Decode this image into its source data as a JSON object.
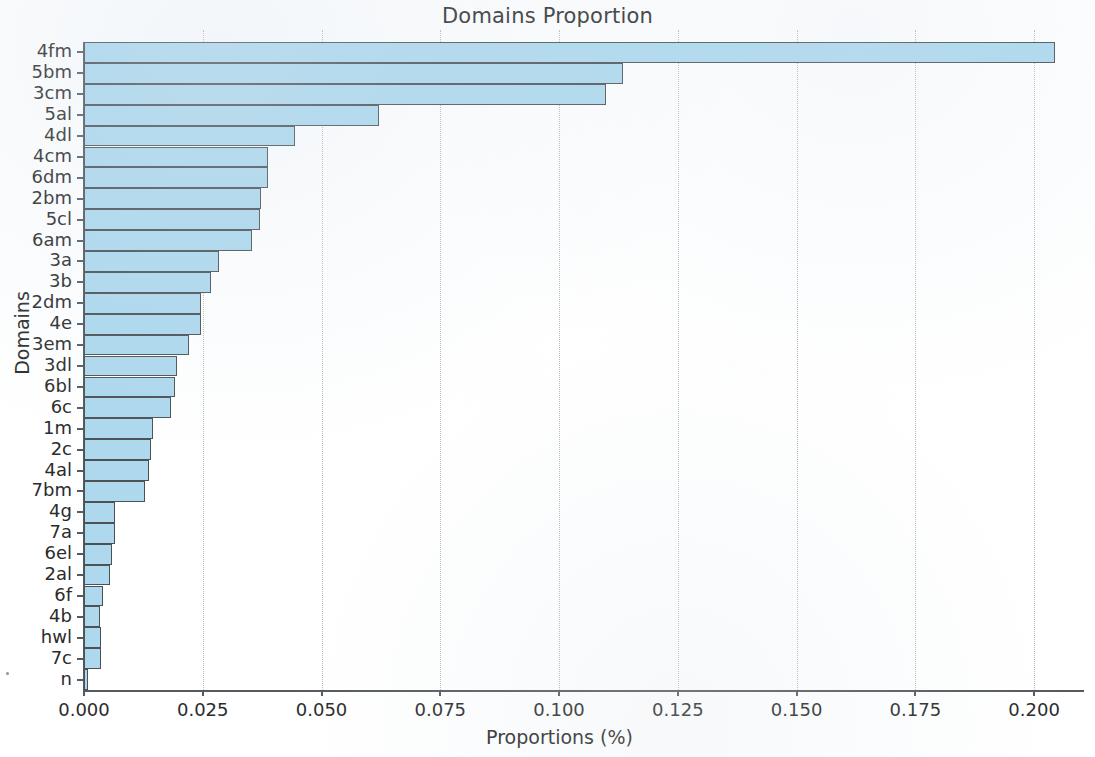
{
  "chart_data": {
    "type": "bar",
    "orientation": "horizontal",
    "title": "Domains Proportion",
    "xlabel": "Proportions (%)",
    "ylabel": "Domains",
    "xlim": [
      0.0,
      0.2105
    ],
    "grid": true,
    "grid_axis": "x",
    "legend": null,
    "bar_color": "#add8ee",
    "bar_edge_color": "#4b5155",
    "xticks": [
      0.0,
      0.025,
      0.05,
      0.075,
      0.1,
      0.125,
      0.15,
      0.175,
      0.2
    ],
    "xtick_labels": [
      "0.000",
      "0.025",
      "0.050",
      "0.075",
      "0.100",
      "0.125",
      "0.150",
      "0.175",
      "0.200"
    ],
    "categories": [
      "4fm",
      "5bm",
      "3cm",
      "5al",
      "4dl",
      "4cm",
      "6dm",
      "2bm",
      "5cl",
      "6am",
      "3a",
      "3b",
      "2dm",
      "4e",
      "3em",
      "3dl",
      "6bl",
      "6c",
      "1m",
      "2c",
      "4al",
      "7bm",
      "4g",
      "7a",
      "6el",
      "2al",
      "6f",
      "4b",
      "hwl",
      "7c",
      "n"
    ],
    "values": [
      0.2045,
      0.1135,
      0.1098,
      0.062,
      0.0444,
      0.0387,
      0.0387,
      0.0372,
      0.037,
      0.0353,
      0.0284,
      0.0267,
      0.0246,
      0.0246,
      0.0221,
      0.0195,
      0.0191,
      0.0183,
      0.0145,
      0.0141,
      0.0137,
      0.0128,
      0.0066,
      0.0066,
      0.0059,
      0.0055,
      0.004,
      0.0034,
      0.0036,
      0.0036,
      0.0008
    ]
  }
}
